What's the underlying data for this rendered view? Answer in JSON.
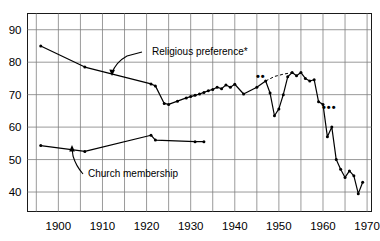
{
  "chart_data": {
    "type": "line",
    "title": "",
    "subtitle": "",
    "xlabel": "",
    "ylabel": "",
    "xlim": [
      1893,
      1971
    ],
    "ylim": [
      34,
      95
    ],
    "grid": true,
    "grid_x_step": 5,
    "grid_y_step": 10,
    "legend_position": "inline-annotations",
    "y_ticks": [
      90,
      80,
      70,
      60,
      50,
      40
    ],
    "y_tick_labels": [
      "90",
      "80",
      "70",
      "60",
      "50",
      "40"
    ],
    "x_ticks": [
      1900,
      1910,
      1920,
      1930,
      1940,
      1950,
      1960,
      1970
    ],
    "x_tick_labels": [
      "1900",
      "1910",
      "1920",
      "1930",
      "1940",
      "1950",
      "1960",
      "1970"
    ],
    "x_gridlines": [
      1895,
      1900,
      1905,
      1910,
      1915,
      1920,
      1925,
      1930,
      1935,
      1940,
      1945,
      1950,
      1955,
      1960,
      1965,
      1970
    ],
    "series": [
      {
        "name": "Religious preference*",
        "label_text": "Religious preference*",
        "style": "solid-with-markers",
        "x": [
          1896,
          1906,
          1921,
          1922,
          1924,
          1925,
          1927,
          1929,
          1930,
          1931,
          1932,
          1933,
          1934,
          1935,
          1936,
          1937,
          1938,
          1939,
          1940,
          1942,
          1945,
          1947,
          1948,
          1949,
          1950,
          1951,
          1952,
          1953,
          1954,
          1955,
          1956,
          1957,
          1958,
          1959,
          1960,
          1961,
          1962,
          1963,
          1964,
          1965,
          1966,
          1967,
          1968,
          1969
        ],
        "y": [
          85.0,
          78.5,
          73.3,
          72.7,
          67.3,
          67.0,
          68.0,
          69.0,
          69.4,
          69.8,
          70.2,
          70.7,
          71.2,
          71.6,
          72.3,
          71.8,
          73.0,
          72.3,
          73.2,
          70.2,
          72.3,
          74.2,
          70.5,
          63.5,
          65.6,
          70.0,
          75.5,
          76.8,
          75.8,
          76.8,
          75.0,
          74.2,
          74.6,
          67.8,
          67.0,
          57.0,
          60.0,
          50.0,
          47.0,
          44.5,
          46.5,
          45.0,
          39.5,
          43.0
        ],
        "dashed_segment": {
          "x": [
            1947,
            1949,
            1951,
            1953
          ],
          "y": [
            74.2,
            75.6,
            76.3,
            76.8
          ]
        }
      },
      {
        "name": "Church membership",
        "label_text": "Church membership",
        "style": "solid-with-markers",
        "x": [
          1896,
          1906,
          1921,
          1922,
          1931,
          1933
        ],
        "y": [
          54.3,
          52.5,
          57.5,
          56.0,
          55.5,
          55.5
        ]
      }
    ],
    "annotations": [
      {
        "id": "religious-preference-label",
        "text": "Religious preference*",
        "x_px": 152,
        "y_px": 55
      },
      {
        "id": "church-membership-label",
        "text": "Church membership",
        "x_px": 88,
        "y_px": 177
      },
      {
        "id": "footnote-marker-two-star",
        "text": "••",
        "x_px": 256,
        "y_px": 80
      },
      {
        "id": "footnote-marker-three-star",
        "text": "•••",
        "x_px": 322,
        "y_px": 111
      }
    ]
  }
}
